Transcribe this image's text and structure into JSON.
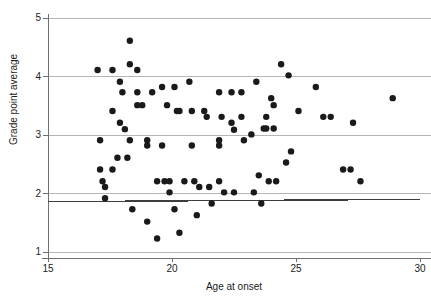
{
  "chart_data": {
    "type": "scatter",
    "title": "",
    "xlabel": "Age at onset",
    "ylabel": "Grade point average",
    "xlim": [
      15,
      30
    ],
    "ylim": [
      1,
      5
    ],
    "xticks": [
      15,
      20,
      25,
      30
    ],
    "yticks": [
      1,
      2,
      3,
      4,
      5
    ],
    "xtick_labels": [
      "15",
      "20",
      "25",
      "30"
    ],
    "ytick_labels": [
      "1",
      "2",
      "3",
      "4",
      "5"
    ],
    "grid": "horizontal gridlines at y = 1, 2, 3, 4, 5",
    "legend": "none",
    "marker": {
      "shape": "circle",
      "color": "#1a1a1a",
      "size_px": 3.2
    },
    "reference_line": {
      "description": "dark horizontal reference line near y = 1.87 spanning full x range",
      "color": "#3d3d3d",
      "x_start": 15,
      "y_start": 1.86,
      "x_end": 30,
      "y_end": 1.9
    },
    "points": [
      {
        "x": 17.0,
        "y": 4.11
      },
      {
        "x": 17.1,
        "y": 2.91
      },
      {
        "x": 17.1,
        "y": 2.41
      },
      {
        "x": 17.2,
        "y": 2.21
      },
      {
        "x": 17.3,
        "y": 2.11
      },
      {
        "x": 17.3,
        "y": 1.92
      },
      {
        "x": 17.6,
        "y": 4.11
      },
      {
        "x": 17.6,
        "y": 3.41
      },
      {
        "x": 17.6,
        "y": 2.41
      },
      {
        "x": 17.8,
        "y": 2.61
      },
      {
        "x": 17.9,
        "y": 3.91
      },
      {
        "x": 17.9,
        "y": 3.21
      },
      {
        "x": 18.0,
        "y": 3.73
      },
      {
        "x": 18.1,
        "y": 3.1
      },
      {
        "x": 18.2,
        "y": 2.61
      },
      {
        "x": 18.3,
        "y": 4.61
      },
      {
        "x": 18.3,
        "y": 4.21
      },
      {
        "x": 18.3,
        "y": 2.91
      },
      {
        "x": 18.4,
        "y": 1.73
      },
      {
        "x": 18.6,
        "y": 4.11
      },
      {
        "x": 18.6,
        "y": 3.73
      },
      {
        "x": 18.6,
        "y": 3.51
      },
      {
        "x": 18.8,
        "y": 3.51
      },
      {
        "x": 19.0,
        "y": 2.91
      },
      {
        "x": 19.0,
        "y": 2.82
      },
      {
        "x": 19.0,
        "y": 1.52
      },
      {
        "x": 19.2,
        "y": 3.73
      },
      {
        "x": 19.4,
        "y": 2.21
      },
      {
        "x": 19.4,
        "y": 1.23
      },
      {
        "x": 19.6,
        "y": 3.82
      },
      {
        "x": 19.6,
        "y": 2.82
      },
      {
        "x": 19.7,
        "y": 2.21
      },
      {
        "x": 19.8,
        "y": 3.51
      },
      {
        "x": 19.9,
        "y": 2.21
      },
      {
        "x": 19.9,
        "y": 2.02
      },
      {
        "x": 20.1,
        "y": 3.82
      },
      {
        "x": 20.1,
        "y": 1.73
      },
      {
        "x": 20.2,
        "y": 3.41
      },
      {
        "x": 20.3,
        "y": 3.41
      },
      {
        "x": 20.3,
        "y": 1.33
      },
      {
        "x": 20.5,
        "y": 2.21
      },
      {
        "x": 20.7,
        "y": 3.91
      },
      {
        "x": 20.8,
        "y": 3.41
      },
      {
        "x": 20.8,
        "y": 2.82
      },
      {
        "x": 20.9,
        "y": 2.21
      },
      {
        "x": 21.0,
        "y": 1.63
      },
      {
        "x": 21.1,
        "y": 2.11
      },
      {
        "x": 21.3,
        "y": 3.41
      },
      {
        "x": 21.4,
        "y": 3.31
      },
      {
        "x": 21.5,
        "y": 2.11
      },
      {
        "x": 21.6,
        "y": 1.83
      },
      {
        "x": 21.9,
        "y": 3.73
      },
      {
        "x": 21.9,
        "y": 2.91
      },
      {
        "x": 21.9,
        "y": 2.82
      },
      {
        "x": 21.9,
        "y": 2.21
      },
      {
        "x": 22.0,
        "y": 3.31
      },
      {
        "x": 22.1,
        "y": 2.02
      },
      {
        "x": 22.4,
        "y": 3.73
      },
      {
        "x": 22.4,
        "y": 3.21
      },
      {
        "x": 22.5,
        "y": 3.09
      },
      {
        "x": 22.5,
        "y": 2.02
      },
      {
        "x": 22.8,
        "y": 3.73
      },
      {
        "x": 22.8,
        "y": 3.31
      },
      {
        "x": 22.9,
        "y": 2.91
      },
      {
        "x": 23.2,
        "y": 3.01
      },
      {
        "x": 23.3,
        "y": 2.02
      },
      {
        "x": 23.4,
        "y": 3.91
      },
      {
        "x": 23.5,
        "y": 2.31
      },
      {
        "x": 23.6,
        "y": 1.83
      },
      {
        "x": 23.7,
        "y": 3.11
      },
      {
        "x": 23.8,
        "y": 3.11
      },
      {
        "x": 23.8,
        "y": 3.31
      },
      {
        "x": 23.9,
        "y": 2.21
      },
      {
        "x": 24.0,
        "y": 3.63
      },
      {
        "x": 24.1,
        "y": 3.51
      },
      {
        "x": 24.1,
        "y": 3.11
      },
      {
        "x": 24.2,
        "y": 2.21
      },
      {
        "x": 24.4,
        "y": 4.21
      },
      {
        "x": 24.6,
        "y": 2.53
      },
      {
        "x": 24.7,
        "y": 4.02
      },
      {
        "x": 24.8,
        "y": 2.72
      },
      {
        "x": 25.1,
        "y": 3.41
      },
      {
        "x": 25.8,
        "y": 3.82
      },
      {
        "x": 26.1,
        "y": 3.31
      },
      {
        "x": 26.4,
        "y": 3.31
      },
      {
        "x": 26.9,
        "y": 2.41
      },
      {
        "x": 27.2,
        "y": 2.41
      },
      {
        "x": 27.3,
        "y": 3.21
      },
      {
        "x": 27.6,
        "y": 2.21
      },
      {
        "x": 28.9,
        "y": 3.63
      }
    ]
  },
  "axes": {
    "x_title": "Age at onset",
    "y_title": "Grade point average",
    "x_tick_labels": [
      "15",
      "20",
      "25",
      "30"
    ],
    "y_tick_labels": [
      "1",
      "2",
      "3",
      "4",
      "5"
    ]
  },
  "colors": {
    "marker": "#1a1a1a",
    "gridline": "#b5b5b5",
    "axis": "#6f6f6f",
    "reference_line": "#3d3d3d",
    "background": "#ffffff"
  }
}
